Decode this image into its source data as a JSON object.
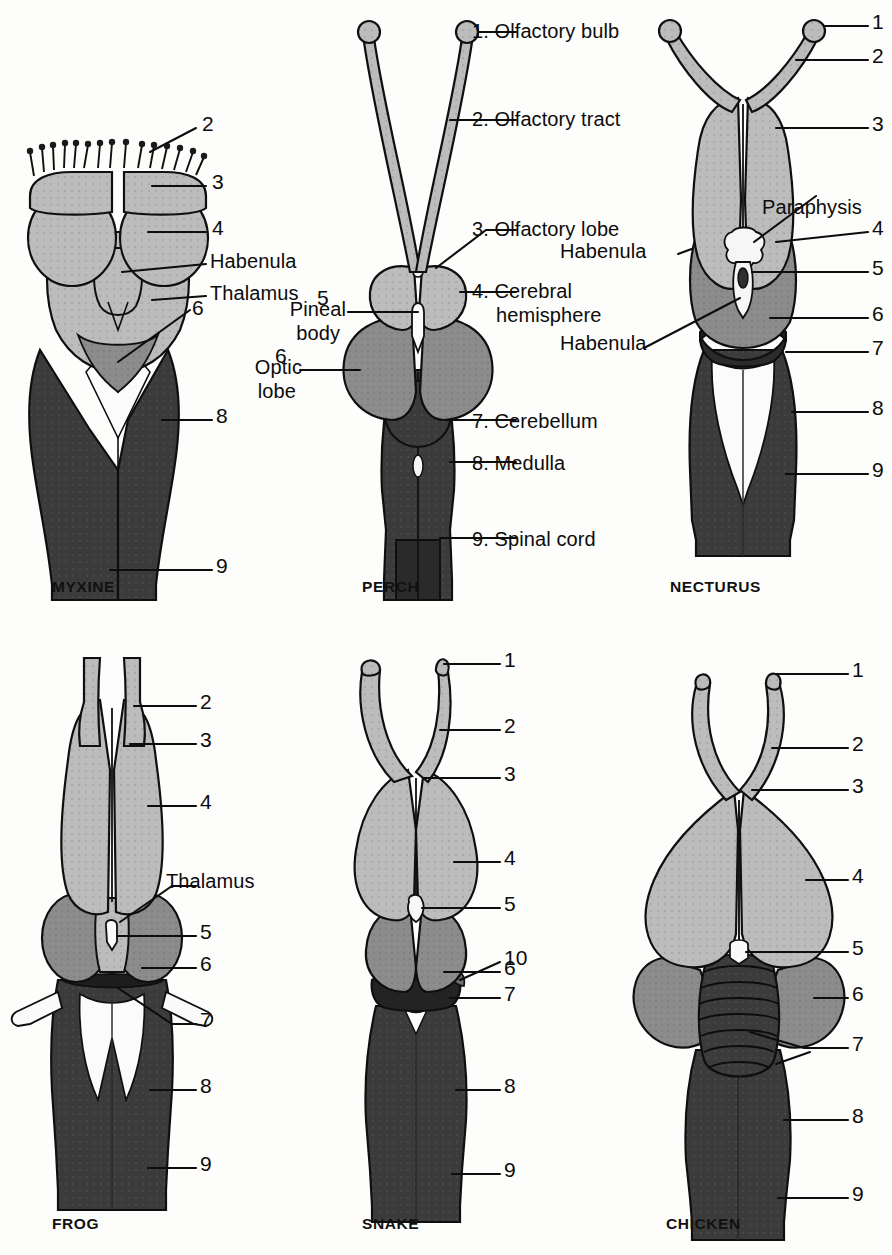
{
  "figure": {
    "colors": {
      "forebrain_light": "#b9b9b9",
      "midbrain_medium": "#8a8a8a",
      "hindbrain_dark": "#3a3a3a",
      "outline": "#111111",
      "background": "#fdfdfb",
      "nerve_white": "#fbfbfb"
    }
  },
  "legend": {
    "items": [
      {
        "num": "1.",
        "text": "Olfactory bulb"
      },
      {
        "num": "2.",
        "text": "Olfactory tract"
      },
      {
        "num": "3.",
        "text": "Olfactory lobe"
      },
      {
        "num": "4.",
        "text": "Cerebral"
      },
      {
        "num": "4b",
        "text": "hemisphere"
      },
      {
        "num": "7.",
        "text": "Cerebellum"
      },
      {
        "num": "8.",
        "text": "Medulla"
      },
      {
        "num": "9.",
        "text": "Spinal cord"
      }
    ],
    "item1": "1. Olfactory bulb",
    "item2": "2. Olfactory tract",
    "item3": "3. Olfactory lobe",
    "item4_line1": "4. Cerebral",
    "item4_line2": "hemisphere",
    "item7": "7. Cerebellum",
    "item8": "8. Medulla",
    "item9": "9. Spinal cord"
  },
  "panels": {
    "myxine": {
      "caption": "MYXINE",
      "labels": {
        "n2": "2",
        "n3": "3",
        "n4": "4",
        "habenula": "Habenula",
        "thalamus": "Thalamus",
        "n6": "6",
        "n8": "8",
        "n9": "9"
      }
    },
    "perch": {
      "caption": "PERCH",
      "labels": {
        "n5": "5",
        "pineal_line1": "Pineal",
        "pineal_line2": "body",
        "n6": "6",
        "optic_line1": "Optic",
        "optic_line2": "lobe",
        "habenula": "Habenula"
      }
    },
    "necturus": {
      "caption": "NECTURUS",
      "labels": {
        "n1": "1",
        "n2": "2",
        "n3": "3",
        "paraphysis": "Paraphysis",
        "n4": "4",
        "n5": "5",
        "n6": "6",
        "habenula": "Habenula",
        "n7": "7",
        "n8": "8",
        "n9": "9"
      }
    },
    "frog": {
      "caption": "FROG",
      "labels": {
        "n2": "2",
        "n3": "3",
        "n4": "4",
        "thalamus": "Thalamus",
        "n5": "5",
        "n6": "6",
        "n7": "7",
        "n8": "8",
        "n9": "9"
      }
    },
    "snake": {
      "caption": "SNAKE",
      "labels": {
        "n1": "1",
        "n2": "2",
        "n3": "3",
        "n4": "4",
        "n5": "5",
        "n6": "6",
        "n10": "10",
        "n7": "7",
        "n8": "8",
        "n9": "9"
      }
    },
    "chicken": {
      "caption": "CHICKEN",
      "labels": {
        "n1": "1",
        "n2": "2",
        "n3": "3",
        "n4": "4",
        "n5": "5",
        "n6": "6",
        "n7": "7",
        "n8": "8",
        "n9": "9"
      }
    }
  }
}
